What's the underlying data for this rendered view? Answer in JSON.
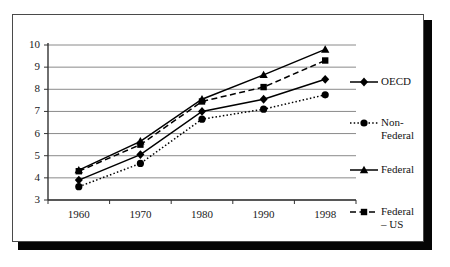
{
  "chart_data": {
    "type": "line",
    "title": "",
    "xlabel": "",
    "ylabel": "",
    "categories": [
      "1960",
      "1970",
      "1980",
      "1990",
      "1998"
    ],
    "ylim": [
      3,
      10
    ],
    "yticks": [
      "3",
      "4",
      "5",
      "6",
      "7",
      "8",
      "9",
      "10"
    ],
    "grid": true,
    "legend_position": "right",
    "series": [
      {
        "name": "OECD",
        "label": "OECD",
        "marker": "diamond",
        "line_style": "solid",
        "color": "#000000",
        "values": [
          3.9,
          5.05,
          7.0,
          7.55,
          8.45
        ]
      },
      {
        "name": "Non-Federal",
        "label": "Non-\nFederal",
        "marker": "circle",
        "line_style": "dotted",
        "color": "#000000",
        "values": [
          3.6,
          4.65,
          6.65,
          7.1,
          7.75
        ]
      },
      {
        "name": "Federal",
        "label": "Federal",
        "marker": "triangle",
        "line_style": "solid",
        "color": "#000000",
        "values": [
          4.35,
          5.65,
          7.55,
          8.65,
          9.8
        ]
      },
      {
        "name": "Federal - US",
        "label": "Federal\n– US",
        "marker": "square",
        "line_style": "dashed",
        "color": "#000000",
        "values": [
          4.3,
          5.5,
          7.45,
          8.1,
          9.3
        ]
      }
    ]
  },
  "axis": {
    "y_labels": [
      "10",
      "9",
      "8",
      "7",
      "6",
      "5",
      "4",
      "3"
    ],
    "x_labels": [
      "1960",
      "1970",
      "1980",
      "1990",
      "1998"
    ]
  },
  "legend": {
    "items": [
      {
        "label": "OECD"
      },
      {
        "label": "Non-\nFederal"
      },
      {
        "label": "Federal"
      },
      {
        "label": "Federal\n– US"
      }
    ]
  },
  "style": {
    "grid_color": "#8a8a8a",
    "axis_color": "#333333",
    "series_color": "#000000",
    "frame_color": "#4a4a4a",
    "shadow_color": "#050505",
    "background": "#ffffff"
  }
}
